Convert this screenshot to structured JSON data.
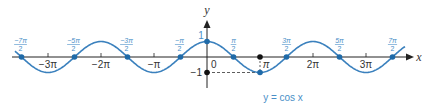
{
  "chart_data": {
    "type": "line",
    "title": "y = cos x",
    "function": "cos",
    "xlabel": "x",
    "ylabel": "y",
    "xlim": [
      -3.85,
      3.85
    ],
    "ylim": [
      -1,
      1
    ],
    "x_unit": "pi",
    "grid": false,
    "x_ticks": [
      {
        "value": -3,
        "label": "−3π"
      },
      {
        "value": -2,
        "label": "−2π"
      },
      {
        "value": -1,
        "label": "−π"
      },
      {
        "value": 1,
        "label": "π"
      },
      {
        "value": 2,
        "label": "2π"
      },
      {
        "value": 3,
        "label": "3π"
      }
    ],
    "origin_label": "0",
    "y_ticks": [
      {
        "value": 1,
        "label": "1"
      },
      {
        "value": -1,
        "label": "−1"
      }
    ],
    "zeros": [
      {
        "value": -3.5,
        "num": "−7π",
        "den": "2"
      },
      {
        "value": -2.5,
        "num": "−5π",
        "den": "2"
      },
      {
        "value": -1.5,
        "num": "−3π",
        "den": "2"
      },
      {
        "value": -0.5,
        "num": "−π",
        "den": "2"
      },
      {
        "value": 0.5,
        "num": "π",
        "den": "2"
      },
      {
        "value": 1.5,
        "num": "3π",
        "den": "2"
      },
      {
        "value": 2.5,
        "num": "5π",
        "den": "2"
      },
      {
        "value": 3.5,
        "num": "7π",
        "den": "2"
      }
    ],
    "highlighted_points": [
      {
        "x": 0,
        "y": 1
      },
      {
        "x": 1,
        "y": -1
      }
    ],
    "reference_points": [
      {
        "x": 0,
        "y": -1
      },
      {
        "x": 1,
        "y": 0
      }
    ],
    "colors": {
      "curve": "#3a80bd",
      "points": "#1f6aa8",
      "labels": "#4a8fc7",
      "axis": "#222222"
    }
  },
  "layout": {
    "origin_x": 207,
    "origin_y": 57,
    "px_per_pi": 53,
    "amplitude_px": 15.5,
    "curve_x_start": 15,
    "curve_x_end": 405
  }
}
